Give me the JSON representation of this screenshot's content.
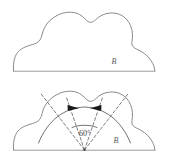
{
  "figure": {
    "background_color": "#ffffff",
    "outline_color": "#8a8a8a",
    "dashed_color": "#6f6f6f",
    "arrow_color": "#1a1a1a",
    "label_color": "#5a5a5a",
    "panels": [
      {
        "name": "upper-panel",
        "region_label": "B",
        "baseline_label": "",
        "has_annotations": false
      },
      {
        "name": "lower-panel",
        "region_label": "B",
        "angle_label": "60°",
        "angle_value": 60,
        "angle_unit": "degrees",
        "has_annotations": true,
        "arrow_count": 2,
        "dashed_ray_count": 4
      }
    ]
  },
  "labels": {
    "upper_region": "B",
    "lower_region": "B",
    "angle": "60°"
  },
  "icons": {
    "left_arrowhead": "arrowhead-right-icon",
    "right_arrowhead": "arrowhead-left-icon",
    "vertex": "vertex-point-icon"
  }
}
